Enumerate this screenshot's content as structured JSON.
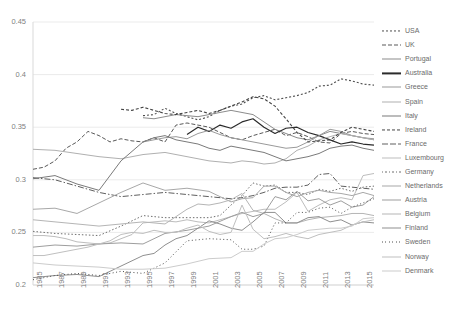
{
  "chart_data": {
    "type": "line",
    "title": "",
    "xlabel": "",
    "ylabel": "",
    "xlim": [
      1985,
      2016
    ],
    "ylim": [
      0.2,
      0.45
    ],
    "yticks": [
      "0.2",
      "0.25",
      "0.3",
      "0.35",
      "0.4",
      "0.45"
    ],
    "ytick_values": [
      0.2,
      0.25,
      0.3,
      0.35,
      0.4,
      0.45
    ],
    "xticks": [
      "1985",
      "1987",
      "1989",
      "1991",
      "1993",
      "1995",
      "1997",
      "1999",
      "2001",
      "2003",
      "2005",
      "2007",
      "2009",
      "2011",
      "2013",
      "2015"
    ],
    "xtick_values": [
      1985,
      1987,
      1989,
      1991,
      1993,
      1995,
      1997,
      1999,
      2001,
      2003,
      2005,
      2007,
      2009,
      2011,
      2013,
      2015
    ],
    "grid": "horizontal",
    "legend_position": "right",
    "series": [
      {
        "name": "USA",
        "color": "#4d4d4d",
        "dash": "2,2",
        "width": 1.1,
        "x": [
          1995,
          1996,
          1997,
          1998,
          1999,
          2000,
          2001,
          2002,
          2003,
          2004,
          2005,
          2006,
          2007,
          2008,
          2009,
          2010,
          2011,
          2012,
          2013,
          2014,
          2015,
          2016
        ],
        "y": [
          0.361,
          0.362,
          0.368,
          0.363,
          0.36,
          0.357,
          0.36,
          0.366,
          0.37,
          0.372,
          0.378,
          0.38,
          0.376,
          0.378,
          0.38,
          0.383,
          0.389,
          0.39,
          0.396,
          0.394,
          0.391,
          0.39
        ]
      },
      {
        "name": "UK",
        "color": "#595959",
        "dash": "4,2",
        "width": 1.0,
        "x": [
          1985,
          1986,
          1987,
          1988,
          1989,
          1990,
          1991,
          1992,
          1993,
          1994,
          1995,
          1996,
          1997,
          1998,
          1999,
          2000,
          2001,
          2002,
          2003,
          2004,
          2005,
          2006,
          2007,
          2008,
          2009,
          2010,
          2011,
          2012,
          2013,
          2014,
          2015,
          2016
        ],
        "y": [
          0.31,
          0.312,
          0.318,
          0.33,
          0.336,
          0.346,
          0.342,
          0.336,
          0.339,
          0.337,
          0.336,
          0.34,
          0.336,
          0.352,
          0.354,
          0.352,
          0.35,
          0.345,
          0.34,
          0.338,
          0.342,
          0.345,
          0.348,
          0.342,
          0.345,
          0.341,
          0.336,
          0.335,
          0.344,
          0.346,
          0.344,
          0.343
        ]
      },
      {
        "name": "Portugal",
        "color": "#8c8c8c",
        "dash": "none",
        "width": 1.0,
        "x": [
          1995,
          1996,
          1997,
          1998,
          1999,
          2000,
          2001,
          2002,
          2003,
          2004,
          2005,
          2006,
          2007,
          2008,
          2009,
          2010,
          2011,
          2012,
          2013,
          2014,
          2015,
          2016
        ],
        "y": [
          0.359,
          0.358,
          0.36,
          0.362,
          0.361,
          0.36,
          0.362,
          0.364,
          0.366,
          0.364,
          0.362,
          0.355,
          0.348,
          0.344,
          0.34,
          0.338,
          0.342,
          0.346,
          0.344,
          0.342,
          0.34,
          0.338
        ]
      },
      {
        "name": "Australia",
        "color": "#2b2b2b",
        "dash": "none",
        "width": 1.2,
        "x": [
          1999,
          2000,
          2001,
          2002,
          2003,
          2004,
          2005,
          2006,
          2007,
          2008,
          2009,
          2010,
          2011,
          2012,
          2013,
          2014,
          2015,
          2016
        ],
        "y": [
          0.343,
          0.35,
          0.346,
          0.352,
          0.349,
          0.355,
          0.358,
          0.35,
          0.344,
          0.349,
          0.35,
          0.345,
          0.342,
          0.338,
          0.334,
          0.336,
          0.334,
          0.333
        ]
      },
      {
        "name": "Greece",
        "color": "#9a9a9a",
        "dash": "none",
        "width": 1.0,
        "x": [
          1995,
          1996,
          1997,
          1998,
          1999,
          2000,
          2001,
          2002,
          2003,
          2004,
          2005,
          2006,
          2007,
          2008,
          2009,
          2010,
          2011,
          2012,
          2013,
          2014,
          2015,
          2016
        ],
        "y": [
          0.336,
          0.338,
          0.34,
          0.341,
          0.339,
          0.344,
          0.347,
          0.343,
          0.34,
          0.338,
          0.336,
          0.334,
          0.332,
          0.33,
          0.331,
          0.336,
          0.342,
          0.348,
          0.346,
          0.342,
          0.34,
          0.339
        ]
      },
      {
        "name": "Spain",
        "color": "#b0b0b0",
        "dash": "none",
        "width": 1.0,
        "x": [
          1985,
          1987,
          1989,
          1991,
          1993,
          1995,
          1997,
          1999,
          2001,
          2003,
          2004,
          2005,
          2006,
          2007,
          2008,
          2009,
          2010,
          2011,
          2012,
          2013,
          2014,
          2015,
          2016
        ],
        "y": [
          0.329,
          0.328,
          0.325,
          0.322,
          0.32,
          0.324,
          0.326,
          0.322,
          0.318,
          0.316,
          0.318,
          0.317,
          0.315,
          0.316,
          0.32,
          0.328,
          0.332,
          0.338,
          0.341,
          0.344,
          0.342,
          0.34,
          0.338
        ]
      },
      {
        "name": "Italy",
        "color": "#7a7a7a",
        "dash": "none",
        "width": 1.0,
        "x": [
          1985,
          1987,
          1989,
          1991,
          1993,
          1995,
          1996,
          1997,
          1998,
          1999,
          2000,
          2001,
          2002,
          2003,
          2004,
          2005,
          2006,
          2007,
          2008,
          2009,
          2010,
          2011,
          2012,
          2013,
          2014,
          2015,
          2016
        ],
        "y": [
          0.301,
          0.304,
          0.296,
          0.29,
          0.318,
          0.336,
          0.34,
          0.342,
          0.338,
          0.336,
          0.334,
          0.33,
          0.328,
          0.332,
          0.33,
          0.328,
          0.326,
          0.322,
          0.318,
          0.32,
          0.322,
          0.325,
          0.33,
          0.332,
          0.333,
          0.33,
          0.328
        ]
      },
      {
        "name": "Ireland",
        "color": "#444444",
        "dash": "3,2",
        "width": 1.1,
        "x": [
          1993,
          1994,
          1995,
          1996,
          1997,
          1998,
          1999,
          2000,
          2001,
          2002,
          2003,
          2004,
          2005,
          2006,
          2007,
          2008,
          2009,
          2010,
          2011,
          2012,
          2013,
          2014,
          2015,
          2016
        ],
        "y": [
          0.367,
          0.366,
          0.369,
          0.366,
          0.363,
          0.362,
          0.364,
          0.366,
          0.363,
          0.366,
          0.37,
          0.374,
          0.379,
          0.377,
          0.37,
          0.358,
          0.345,
          0.336,
          0.337,
          0.338,
          0.345,
          0.35,
          0.348,
          0.346
        ]
      },
      {
        "name": "France",
        "color": "#5f5f5f",
        "dash": "6,2,1.5,2",
        "width": 1.0,
        "x": [
          1985,
          1987,
          1989,
          1991,
          1993,
          1995,
          1997,
          1999,
          2001,
          2003,
          2004,
          2005,
          2006,
          2007,
          2008,
          2009,
          2010,
          2011,
          2012,
          2013,
          2014,
          2015,
          2016
        ],
        "y": [
          0.302,
          0.3,
          0.294,
          0.288,
          0.284,
          0.286,
          0.288,
          0.286,
          0.284,
          0.282,
          0.283,
          0.285,
          0.288,
          0.292,
          0.293,
          0.293,
          0.295,
          0.305,
          0.306,
          0.294,
          0.293,
          0.292,
          0.291
        ]
      },
      {
        "name": "Luxembourg",
        "color": "#bdbdbd",
        "dash": "none",
        "width": 1.0,
        "x": [
          1985,
          1986,
          1987,
          1988,
          1989,
          1990,
          1991,
          1992,
          1993,
          1994,
          1995,
          1996,
          1997,
          1998,
          1999,
          2000,
          2001,
          2002,
          2003,
          2004,
          2005,
          2006,
          2007,
          2008,
          2009,
          2010,
          2011,
          2012,
          2013,
          2014,
          2015,
          2016
        ],
        "y": [
          0.247,
          0.247,
          0.246,
          0.244,
          0.241,
          0.24,
          0.239,
          0.24,
          0.244,
          0.248,
          0.259,
          0.26,
          0.261,
          0.26,
          0.262,
          0.26,
          0.259,
          0.262,
          0.265,
          0.268,
          0.27,
          0.272,
          0.272,
          0.279,
          0.288,
          0.27,
          0.276,
          0.281,
          0.283,
          0.281,
          0.304,
          0.306
        ]
      },
      {
        "name": "Germany",
        "color": "#6e6e6e",
        "dash": "1.5,2",
        "width": 1.0,
        "x": [
          1985,
          1987,
          1989,
          1991,
          1993,
          1995,
          1997,
          1999,
          2000,
          2001,
          2002,
          2003,
          2004,
          2005,
          2006,
          2007,
          2008,
          2009,
          2010,
          2011,
          2012,
          2013,
          2014,
          2015,
          2016
        ],
        "y": [
          0.251,
          0.249,
          0.248,
          0.247,
          0.256,
          0.266,
          0.264,
          0.264,
          0.264,
          0.264,
          0.266,
          0.276,
          0.285,
          0.297,
          0.294,
          0.295,
          0.288,
          0.288,
          0.286,
          0.291,
          0.289,
          0.292,
          0.289,
          0.293,
          0.294
        ]
      },
      {
        "name": "Netherlands",
        "color": "#a8a8a8",
        "dash": "none",
        "width": 1.0,
        "x": [
          1985,
          1987,
          1989,
          1991,
          1993,
          1995,
          1997,
          1999,
          2001,
          2003,
          2004,
          2005,
          2006,
          2007,
          2008,
          2009,
          2010,
          2011,
          2012,
          2013,
          2014,
          2015,
          2016
        ],
        "y": [
          0.272,
          0.273,
          0.268,
          0.278,
          0.288,
          0.297,
          0.29,
          0.292,
          0.289,
          0.279,
          0.282,
          0.283,
          0.294,
          0.294,
          0.288,
          0.284,
          0.288,
          0.29,
          0.288,
          0.287,
          0.285,
          0.288,
          0.285
        ]
      },
      {
        "name": "Austria",
        "color": "#9e9e9e",
        "dash": "none",
        "width": 1.0,
        "x": [
          1985,
          1987,
          1989,
          1991,
          1993,
          1995,
          1997,
          1999,
          2001,
          2003,
          2004,
          2005,
          2006,
          2007,
          2008,
          2009,
          2010,
          2011,
          2012,
          2013,
          2014,
          2015,
          2016
        ],
        "y": [
          0.236,
          0.238,
          0.237,
          0.239,
          0.24,
          0.239,
          0.249,
          0.252,
          0.256,
          0.265,
          0.269,
          0.265,
          0.268,
          0.284,
          0.281,
          0.289,
          0.28,
          0.282,
          0.276,
          0.28,
          0.274,
          0.276,
          0.284
        ]
      },
      {
        "name": "Belgium",
        "color": "#b5b5b5",
        "dash": "none",
        "width": 1.0,
        "x": [
          1985,
          1987,
          1989,
          1991,
          1993,
          1995,
          1997,
          1999,
          2000,
          2001,
          2002,
          2003,
          2004,
          2005,
          2006,
          2007,
          2008,
          2009,
          2010,
          2011,
          2012,
          2013,
          2014,
          2015,
          2016
        ],
        "y": [
          0.262,
          0.26,
          0.258,
          0.256,
          0.258,
          0.26,
          0.258,
          0.272,
          0.277,
          0.276,
          0.278,
          0.281,
          0.287,
          0.271,
          0.268,
          0.263,
          0.259,
          0.259,
          0.262,
          0.264,
          0.265,
          0.266,
          0.268,
          0.268,
          0.266
        ]
      },
      {
        "name": "Finland",
        "color": "#8f8f8f",
        "dash": "none",
        "width": 1.0,
        "x": [
          1985,
          1987,
          1989,
          1991,
          1993,
          1995,
          1996,
          1997,
          1998,
          1999,
          2000,
          2001,
          2002,
          2003,
          2004,
          2005,
          2006,
          2007,
          2008,
          2009,
          2010,
          2011,
          2012,
          2013,
          2014,
          2015,
          2016
        ],
        "y": [
          0.207,
          0.209,
          0.21,
          0.208,
          0.218,
          0.228,
          0.23,
          0.238,
          0.244,
          0.247,
          0.254,
          0.261,
          0.258,
          0.254,
          0.252,
          0.26,
          0.269,
          0.269,
          0.259,
          0.259,
          0.264,
          0.265,
          0.26,
          0.262,
          0.257,
          0.26,
          0.259
        ]
      },
      {
        "name": "Sweden",
        "color": "#4f4f4f",
        "dash": "1,2.5",
        "width": 1.0,
        "x": [
          1985,
          1987,
          1989,
          1991,
          1993,
          1995,
          1997,
          1999,
          2001,
          2003,
          2004,
          2005,
          2006,
          2007,
          2008,
          2009,
          2010,
          2011,
          2012,
          2013,
          2014,
          2015,
          2016
        ],
        "y": [
          0.205,
          0.209,
          0.211,
          0.209,
          0.213,
          0.211,
          0.221,
          0.242,
          0.244,
          0.243,
          0.234,
          0.234,
          0.237,
          0.259,
          0.259,
          0.269,
          0.269,
          0.273,
          0.274,
          0.268,
          0.274,
          0.278,
          0.282
        ]
      },
      {
        "name": "Norway",
        "color": "#bfbfbf",
        "dash": "none",
        "width": 1.0,
        "x": [
          1985,
          1986,
          1987,
          1988,
          1989,
          1990,
          1991,
          1992,
          1993,
          1994,
          1995,
          1996,
          1997,
          1998,
          1999,
          2000,
          2001,
          2002,
          2003,
          2004,
          2005,
          2006,
          2007,
          2008,
          2009,
          2010,
          2011,
          2012,
          2013,
          2014,
          2015,
          2016
        ],
        "y": [
          0.228,
          0.228,
          0.23,
          0.232,
          0.234,
          0.236,
          0.239,
          0.242,
          0.248,
          0.25,
          0.249,
          0.252,
          0.25,
          0.25,
          0.254,
          0.257,
          0.251,
          0.248,
          0.25,
          0.276,
          0.253,
          0.244,
          0.246,
          0.249,
          0.246,
          0.244,
          0.248,
          0.25,
          0.252,
          0.257,
          0.26,
          0.262
        ]
      },
      {
        "name": "Denmark",
        "color": "#cccccc",
        "dash": "none",
        "width": 1.0,
        "x": [
          1985,
          1987,
          1989,
          1991,
          1993,
          1995,
          1997,
          1999,
          2001,
          2003,
          2004,
          2005,
          2006,
          2007,
          2008,
          2009,
          2010,
          2011,
          2012,
          2013,
          2014,
          2015,
          2016
        ],
        "y": [
          0.221,
          0.219,
          0.218,
          0.217,
          0.215,
          0.215,
          0.216,
          0.22,
          0.225,
          0.226,
          0.232,
          0.232,
          0.239,
          0.244,
          0.245,
          0.248,
          0.252,
          0.253,
          0.254,
          0.254,
          0.256,
          0.263,
          0.264
        ]
      }
    ]
  },
  "legend": {
    "items": [
      {
        "label": "USA"
      },
      {
        "label": "UK"
      },
      {
        "label": "Portugal"
      },
      {
        "label": "Australia"
      },
      {
        "label": "Greece"
      },
      {
        "label": "Spain"
      },
      {
        "label": "Italy"
      },
      {
        "label": "Ireland"
      },
      {
        "label": "France"
      },
      {
        "label": "Luxembourg"
      },
      {
        "label": "Germany"
      },
      {
        "label": "Netherlands"
      },
      {
        "label": "Austria"
      },
      {
        "label": "Belgium"
      },
      {
        "label": "Finland"
      },
      {
        "label": "Sweden"
      },
      {
        "label": "Norway"
      },
      {
        "label": "Denmark"
      }
    ]
  },
  "style": {
    "grid_color": "#ebebeb",
    "axis_color": "#d9d9d9",
    "tick_text_color": "#7f7f7f",
    "legend_text_color": "#6b6b6b",
    "background": "#ffffff"
  }
}
